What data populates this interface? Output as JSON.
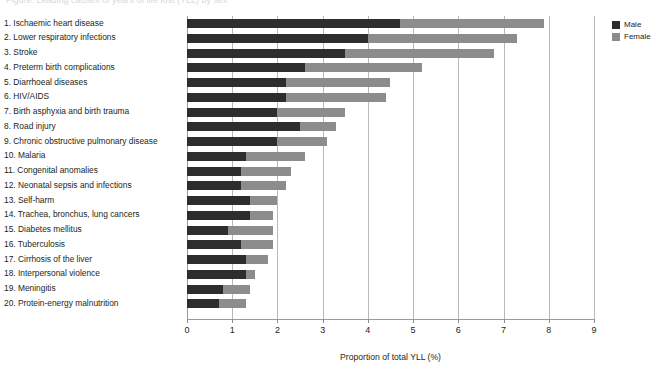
{
  "figure": {
    "title_cropped": "Figure: Leading causes of years of life lost (YLL) by sex",
    "axis_title": "Proportion of total YLL (%)"
  },
  "legend": {
    "position": "top-right",
    "items": [
      {
        "label": "Male",
        "color": "#2d2d2d",
        "swatch_name": "legend-swatch-male"
      },
      {
        "label": "Female",
        "color": "#8c8c8c",
        "swatch_name": "legend-swatch-female"
      }
    ]
  },
  "x_axis": {
    "ticks": [
      "0",
      "1",
      "2",
      "3",
      "4",
      "5",
      "6",
      "7",
      "8",
      "9"
    ],
    "min": 0,
    "max": 9
  },
  "chart_data": {
    "type": "bar",
    "orientation": "horizontal",
    "stacked": true,
    "title": "",
    "xlabel": "Proportion of total YLL (%)",
    "ylabel": "",
    "xlim": [
      0,
      9
    ],
    "grid": true,
    "legend_position": "top-right",
    "categories": [
      "1. Ischaemic heart disease",
      "2. Lower respiratory infections",
      "3. Stroke",
      "4. Preterm birth complications",
      "5. Diarrhoeal diseases",
      "6. HIV/AIDS",
      "7. Birth asphyxia and birth trauma",
      "8. Road injury",
      "9. Chronic obstructive pulmonary disease",
      "10. Malaria",
      "11. Congenital anomalies",
      "12. Neonatal sepsis and infections",
      "13. Self-harm",
      "14. Trachea, bronchus, lung cancers",
      "15. Diabetes mellitus",
      "16. Tuberculosis",
      "17. Cirrhosis of the liver",
      "18. Interpersonal violence",
      "19. Meningitis",
      "20. Protein-energy malnutrition"
    ],
    "series": [
      {
        "name": "Male",
        "color": "#2d2d2d",
        "values": [
          4.7,
          4.0,
          3.5,
          2.6,
          2.2,
          2.2,
          2.0,
          2.5,
          2.0,
          1.3,
          1.2,
          1.2,
          1.4,
          1.4,
          0.9,
          1.2,
          1.3,
          1.3,
          0.8,
          0.7
        ]
      },
      {
        "name": "Female",
        "color": "#8c8c8c",
        "values": [
          3.2,
          3.3,
          3.3,
          2.6,
          2.3,
          2.2,
          1.5,
          0.8,
          1.1,
          1.3,
          1.1,
          1.0,
          0.6,
          0.5,
          1.0,
          0.7,
          0.5,
          0.2,
          0.6,
          0.6
        ]
      }
    ],
    "totals": [
      7.9,
      7.3,
      6.8,
      5.2,
      4.5,
      4.4,
      3.5,
      3.3,
      3.1,
      2.6,
      2.3,
      2.2,
      2.0,
      1.9,
      1.9,
      1.9,
      1.8,
      1.5,
      1.4,
      1.3
    ]
  }
}
